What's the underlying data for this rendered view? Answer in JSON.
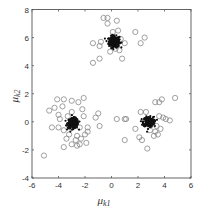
{
  "chart_data": {
    "type": "scatter",
    "title": "",
    "xlabel": "μk1",
    "ylabel": "μk2",
    "xlabel_main": "μ",
    "xlabel_sub": "k1",
    "ylabel_main": "μ",
    "ylabel_sub": "k2",
    "xlim": [
      -6,
      6
    ],
    "ylim": [
      -4,
      8
    ],
    "xticks": [
      -6,
      -4,
      -2,
      0,
      2,
      4,
      6
    ],
    "yticks": [
      -4,
      -2,
      0,
      2,
      4,
      6,
      8
    ],
    "xtick_labels": [
      "-6",
      "-4",
      "-2",
      "0",
      "2",
      "4",
      "6"
    ],
    "ytick_labels": [
      "-4",
      "-2",
      "0",
      "2",
      "4",
      "6",
      "8"
    ],
    "grid": false,
    "legend": null,
    "series": [
      {
        "name": "dense-samples",
        "marker": "dot",
        "color": "#111111",
        "description": "dense black point clouds around three cluster centers",
        "cluster_centers": [
          [
            0.2,
            5.7
          ],
          [
            -2.9,
            -0.1
          ],
          [
            2.8,
            0.0
          ]
        ],
        "cluster_spread": [
          [
            0.25,
            0.25
          ],
          [
            0.25,
            0.22
          ],
          [
            0.25,
            0.22
          ]
        ]
      },
      {
        "name": "outlier-samples",
        "marker": "open-circle",
        "color": "#888888",
        "points": [
          [
            -0.6,
            7.4
          ],
          [
            -0.3,
            7.4
          ],
          [
            0.4,
            7.2
          ],
          [
            -0.3,
            7.0
          ],
          [
            0.1,
            6.4
          ],
          [
            0.5,
            6.5
          ],
          [
            -1.4,
            5.6
          ],
          [
            -0.9,
            5.4
          ],
          [
            -0.8,
            5.7
          ],
          [
            0.7,
            5.9
          ],
          [
            1.0,
            5.6
          ],
          [
            1.8,
            6.4
          ],
          [
            2.5,
            6.0
          ],
          [
            2.2,
            5.6
          ],
          [
            0.6,
            5.1
          ],
          [
            0.8,
            4.5
          ],
          [
            -0.9,
            4.5
          ],
          [
            -1.4,
            4.2
          ],
          [
            0.3,
            5.2
          ],
          [
            -0.1,
            5.0
          ],
          [
            -4.7,
            0.8
          ],
          [
            -4.1,
            1.6
          ],
          [
            -3.6,
            1.6
          ],
          [
            -3.0,
            1.5
          ],
          [
            -2.5,
            1.4
          ],
          [
            -2.1,
            1.7
          ],
          [
            -4.3,
            1.0
          ],
          [
            -3.7,
            1.1
          ],
          [
            -2.2,
            0.9
          ],
          [
            -3.0,
            0.7
          ],
          [
            -4.0,
            0.5
          ],
          [
            -3.3,
            0.4
          ],
          [
            -2.1,
            0.4
          ],
          [
            -1.2,
            0.3
          ],
          [
            -1.0,
            0.6
          ],
          [
            -3.9,
            0.2
          ],
          [
            -4.5,
            -0.4
          ],
          [
            -4.0,
            -0.4
          ],
          [
            -3.6,
            -0.6
          ],
          [
            -2.4,
            -0.4
          ],
          [
            -1.8,
            -0.4
          ],
          [
            -0.9,
            -0.3
          ],
          [
            -3.2,
            -0.9
          ],
          [
            -2.6,
            -1.0
          ],
          [
            -2.0,
            -0.9
          ],
          [
            -3.4,
            -1.2
          ],
          [
            -2.7,
            -1.3
          ],
          [
            -2.3,
            -1.2
          ],
          [
            -3.0,
            -1.6
          ],
          [
            -2.4,
            -1.6
          ],
          [
            -2.6,
            -1.7
          ],
          [
            -3.6,
            -1.8
          ],
          [
            -1.9,
            -1.5
          ],
          [
            -5.1,
            -2.4
          ],
          [
            -1.8,
            -0.7
          ],
          [
            0.4,
            0.2
          ],
          [
            1.0,
            0.2
          ],
          [
            1.1,
            0.2
          ],
          [
            2.2,
            0.7
          ],
          [
            2.6,
            0.7
          ],
          [
            3.3,
            1.4
          ],
          [
            3.6,
            1.4
          ],
          [
            3.8,
            1.6
          ],
          [
            4.8,
            1.7
          ],
          [
            3.6,
            0.4
          ],
          [
            3.9,
            0.3
          ],
          [
            4.1,
            0.2
          ],
          [
            4.4,
            0.1
          ],
          [
            3.4,
            -0.3
          ],
          [
            3.7,
            -0.5
          ],
          [
            3.3,
            -0.7
          ],
          [
            3.5,
            -0.9
          ],
          [
            3.2,
            -1.0
          ],
          [
            2.9,
            -0.6
          ],
          [
            1.8,
            -0.5
          ],
          [
            2.1,
            -1.1
          ],
          [
            2.3,
            -1.3
          ],
          [
            1.0,
            -1.3
          ],
          [
            2.7,
            -1.9
          ]
        ]
      }
    ]
  }
}
